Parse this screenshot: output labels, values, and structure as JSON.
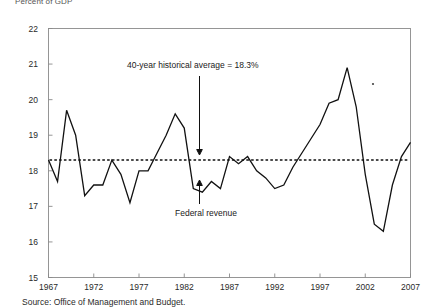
{
  "axis_title": "Percent of GDP",
  "source_note": "Source: Office of Management and Budget.",
  "annotations": {
    "average_label": "40-year historical average = 18.3%",
    "series_label": "Federal revenue"
  },
  "chart_data": {
    "type": "line",
    "title": "",
    "subtitle": "",
    "xlabel": "",
    "ylabel": "Percent of GDP",
    "ylim": [
      15,
      22
    ],
    "xlim": [
      1967,
      2007
    ],
    "ytick_labels": [
      "15",
      "16",
      "17",
      "18",
      "19",
      "20",
      "21",
      "22"
    ],
    "yticks": [
      15,
      16,
      17,
      18,
      19,
      20,
      21,
      22
    ],
    "xtick_labels": [
      "1967",
      "1972",
      "1977",
      "1982",
      "1987",
      "1992",
      "1997",
      "2002",
      "2007"
    ],
    "xticks": [
      1967,
      1972,
      1977,
      1982,
      1987,
      1992,
      1997,
      2002,
      2007
    ],
    "grid": false,
    "legend": "none",
    "x": [
      1967,
      1968,
      1969,
      1970,
      1971,
      1972,
      1973,
      1974,
      1975,
      1976,
      1977,
      1978,
      1979,
      1980,
      1981,
      1982,
      1983,
      1984,
      1985,
      1986,
      1987,
      1988,
      1989,
      1990,
      1991,
      1992,
      1993,
      1994,
      1995,
      1996,
      1997,
      1998,
      1999,
      2000,
      2001,
      2002,
      2003,
      2004,
      2005,
      2006,
      2007
    ],
    "series": [
      {
        "name": "Federal revenue",
        "color": "#111111",
        "values": [
          18.3,
          17.7,
          19.7,
          19.0,
          17.3,
          17.6,
          17.6,
          18.3,
          17.9,
          17.1,
          18.0,
          18.0,
          18.5,
          19.0,
          19.6,
          19.2,
          17.5,
          17.4,
          17.7,
          17.5,
          18.4,
          18.2,
          18.4,
          18.0,
          17.8,
          17.5,
          17.6,
          18.1,
          18.5,
          18.9,
          19.3,
          19.9,
          20.0,
          20.9,
          19.8,
          17.9,
          16.5,
          16.3,
          17.6,
          18.4,
          18.8
        ]
      }
    ],
    "reference_line": {
      "label": "40-year historical average = 18.3%",
      "value": 18.3,
      "style": "dotted"
    }
  }
}
